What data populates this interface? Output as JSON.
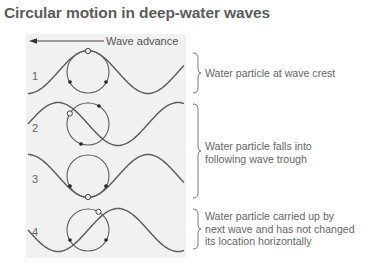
{
  "title": "Circular motion in deep-water waves",
  "wave_advance_label": "Wave advance",
  "rows": [
    {
      "number": "1",
      "particle_position": "crest"
    },
    {
      "number": "2",
      "particle_position": "falling"
    },
    {
      "number": "3",
      "particle_position": "trough"
    },
    {
      "number": "4",
      "particle_position": "rising"
    }
  ],
  "captions": [
    {
      "lines": [
        "Water particle at wave crest"
      ]
    },
    {
      "lines": [
        "Water particle falls into",
        "following wave trough"
      ]
    },
    {
      "lines": [
        "Water particle carried up by",
        "next wave and has not changed",
        "its location horizontally"
      ]
    }
  ],
  "colors": {
    "panel_bg": "#f1f1f1",
    "line": "#5f5f5f",
    "text": "#666666"
  }
}
